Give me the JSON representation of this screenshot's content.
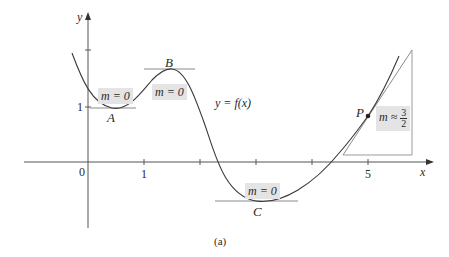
{
  "figure": {
    "caption": "(a)",
    "function_label": "y = f(x)",
    "axes": {
      "x_label": "x",
      "y_label": "y",
      "origin_label": "0",
      "x_tick_labels": [
        {
          "value": 1,
          "label": "1"
        },
        {
          "value": 5,
          "label": "5"
        }
      ],
      "x_ticks": [
        1,
        2,
        3,
        4,
        5
      ],
      "y_tick_labels": [
        {
          "value": 1,
          "label": "1"
        }
      ],
      "y_ticks": [
        1,
        2
      ]
    },
    "points": [
      {
        "name": "A",
        "type": "local minimum",
        "slope_label": "m = 0"
      },
      {
        "name": "B",
        "type": "local maximum",
        "slope_label": "m = 0"
      },
      {
        "name": "C",
        "type": "local minimum",
        "slope_label": "m = 0"
      },
      {
        "name": "P",
        "type": "point on curve",
        "slope_label": "m ≈ 3/2"
      }
    ],
    "p_slope": {
      "prefix": "m ≈",
      "numerator": "3",
      "denominator": "2"
    },
    "colors": {
      "curve": "#3a3a3a",
      "axes": "#555555",
      "tangent": "#8a8a8a",
      "label_box": "#e4e4e4"
    }
  }
}
